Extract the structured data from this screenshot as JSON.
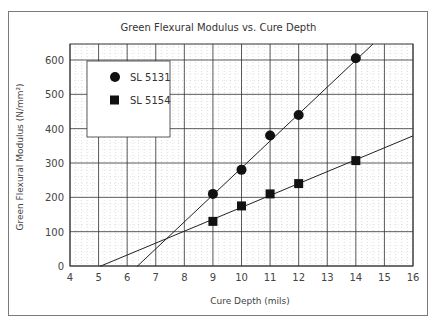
{
  "chart_data": {
    "type": "scatter",
    "title": "Green Flexural Modulus vs. Cure Depth",
    "xlabel": "Cure Depth (mils)",
    "ylabel": "Green Flexural Modulus (N/mm²)",
    "xlim": [
      4,
      16
    ],
    "ylim": [
      0,
      650
    ],
    "xticks": [
      4,
      5,
      6,
      7,
      8,
      9,
      10,
      11,
      12,
      13,
      14,
      15,
      16
    ],
    "yticks": [
      0,
      100,
      200,
      300,
      400,
      500,
      600
    ],
    "grid": true,
    "legend_position": "upper-left",
    "series": [
      {
        "name": "SL 5131",
        "marker": "circle",
        "x": [
          9,
          10,
          11,
          12,
          14
        ],
        "y": [
          210,
          280,
          380,
          440,
          605
        ],
        "fit_line": {
          "x0": 6.35,
          "x1": 14.6
        }
      },
      {
        "name": "SL 5154",
        "marker": "square",
        "x": [
          9,
          10,
          11,
          12,
          14
        ],
        "y": [
          130,
          175,
          210,
          240,
          307
        ],
        "fit_line": {
          "x0": 5.05,
          "x1": 16
        }
      }
    ]
  }
}
